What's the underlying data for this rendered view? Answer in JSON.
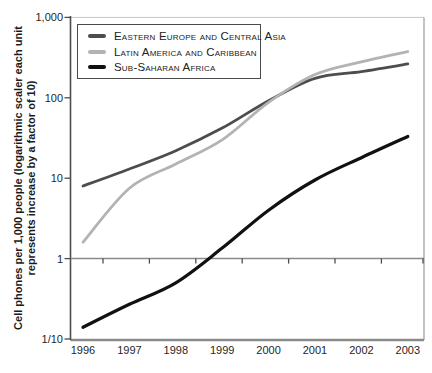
{
  "figure": {
    "background": "#ffffff"
  },
  "chart_data": {
    "type": "line",
    "x": [
      1996,
      1997,
      1998,
      1999,
      2000,
      2001,
      2002,
      2003
    ],
    "x_tick_labels": [
      "1996",
      "1997",
      "1998",
      "1999",
      "2000",
      "2001",
      "2002",
      "2003"
    ],
    "y_axis": {
      "scale": "log",
      "range": [
        0.1,
        1000
      ],
      "tick_values": [
        1000,
        100,
        10,
        1,
        0.1
      ],
      "tick_labels": [
        "1,000",
        "100",
        "10",
        "1",
        "1/10"
      ],
      "title_line1": "Cell phones per 1,000 people (logarithmic scaler each unit",
      "title_line2": "represents increase by a factor of 10)"
    },
    "series": [
      {
        "name": "Eastern Europe and Central Asia",
        "color": "#4d4d4d",
        "stroke_width": 2.8,
        "values": [
          8,
          13,
          22,
          42,
          92,
          175,
          212,
          264
        ]
      },
      {
        "name": "Latin America and Caribbean",
        "color": "#b3b3b3",
        "stroke_width": 2.8,
        "values": [
          1.6,
          7.5,
          15,
          30,
          88,
          195,
          280,
          375
        ]
      },
      {
        "name": "Sub-Saharan Africa",
        "color": "#111111",
        "stroke_width": 3.2,
        "values": [
          0.14,
          0.27,
          0.5,
          1.35,
          4,
          9.5,
          18,
          33
        ]
      }
    ],
    "legend_position": "top-left",
    "grid": "off",
    "reference_line_value": 1
  },
  "axis_style": {
    "left_axis_color": "#4d4d4d",
    "bottom_axis_color": "#8a8a8a",
    "right_border_color": "#9a9a9a",
    "top_border_color": "#c6c6c6",
    "reference_line_color": "#8a8a8a",
    "tick_color": "#4d4d4d"
  }
}
